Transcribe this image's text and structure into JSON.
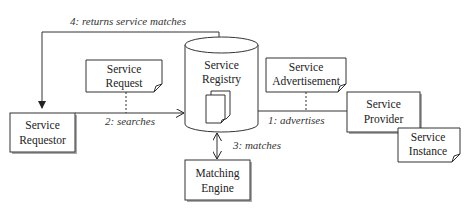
{
  "diagram": {
    "nodes": {
      "requestor": {
        "line1": "Service",
        "line2": "Requestor"
      },
      "registry": {
        "line1": "Service",
        "line2": "Registry"
      },
      "provider": {
        "line1": "Service",
        "line2": "Provider"
      },
      "engine": {
        "line1": "Matching",
        "line2": "Engine"
      }
    },
    "notes": {
      "request": {
        "line1": "Service",
        "line2": "Request"
      },
      "advertisement": {
        "line1": "Service",
        "line2": "Advertisement"
      },
      "instance": {
        "line1": "Service",
        "line2": "Instance"
      }
    },
    "edges": {
      "advertises": "1: advertises",
      "searches": "2: searches",
      "matches": "3: matches",
      "returns": "4: returns service matches"
    },
    "colors": {
      "stroke": "#333333",
      "shadow": "#9a9a9a",
      "fill": "#ffffff"
    }
  }
}
